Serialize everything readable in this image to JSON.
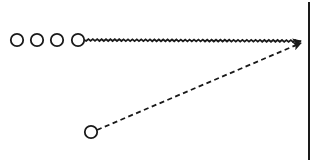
{
  "diagram": {
    "row_circle_count": 4,
    "colors": {
      "stroke": "#1a1a1a",
      "background": "#ffffff"
    },
    "elements": [
      {
        "kind": "circle-row",
        "count": 4
      },
      {
        "kind": "wavy-arrow",
        "from": "last-row-circle",
        "to": "wall"
      },
      {
        "kind": "circle",
        "label": "lower-source"
      },
      {
        "kind": "dashed-arrow",
        "from": "lower-source",
        "to": "wall"
      },
      {
        "kind": "vertical-line",
        "label": "wall"
      }
    ]
  }
}
